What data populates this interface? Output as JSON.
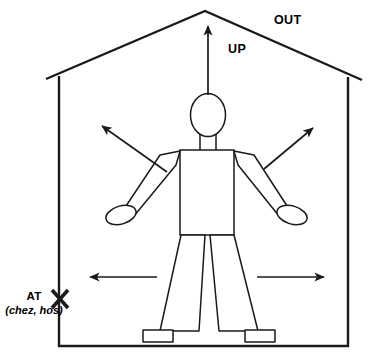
{
  "diagram": {
    "labels": {
      "out": "OUT",
      "up": "UP",
      "at": "AT",
      "at_gloss": "(chez, hos)"
    },
    "icons": {
      "up_arrow": "arrow-up-icon",
      "out_left_arrow": "arrow-up-left-icon",
      "out_right_arrow": "arrow-up-right-icon",
      "left_arrow": "arrow-left-icon",
      "right_arrow": "arrow-right-icon",
      "at_marker": "x-cross-marker-icon",
      "house": "house-outline-icon",
      "figure": "stick-figure-icon"
    },
    "colors": {
      "stroke": "#1a1a1a",
      "fill": "#ffffff",
      "background": "#ffffff"
    }
  }
}
